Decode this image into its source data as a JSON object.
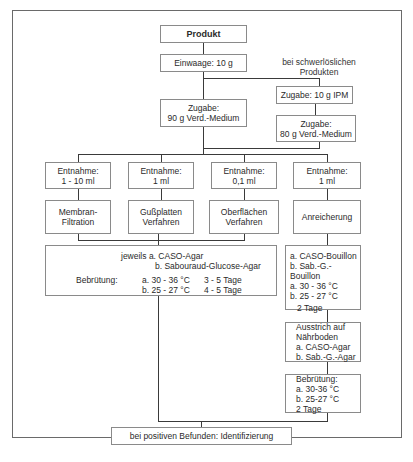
{
  "diagram": {
    "product": "Produkt",
    "weigh_in": "Einwaage: 10 g",
    "side_note": [
      "bei schwerlöslichen",
      "Produkten"
    ],
    "main_addition": [
      "Zugabe:",
      "90 g Verd.-Medium"
    ],
    "ipm_addition": "Zugabe: 10 g IPM",
    "alt_addition": [
      "Zugabe:",
      "80 g Verd.-Medium"
    ],
    "sampling": [
      {
        "line1": "Entnahme:",
        "line2": "1 - 10 ml"
      },
      {
        "line1": "Entnahme:",
        "line2": "1 ml"
      },
      {
        "line1": "Entnahme:",
        "line2": "0,1 ml"
      },
      {
        "line1": "Entnahme:",
        "line2": "1 ml"
      }
    ],
    "methods": [
      {
        "line1": "Membran-",
        "line2": "Filtration"
      },
      {
        "line1": "Gußplatten",
        "line2": "Verfahren"
      },
      {
        "line1": "Oberflächen",
        "line2": "Verfahren"
      },
      {
        "line1": "Anreicherung",
        "line2": ""
      }
    ],
    "media_box": {
      "prefix": "jeweils",
      "media_a": "a. CASO-Agar",
      "media_b": "b. Sabouraud-Glucose-Agar",
      "incubation_label": "Bebrütung:",
      "temp_a": "a. 30 - 36 °C",
      "days_a": "3 - 5 Tage",
      "temp_b": "b. 25 - 27 °C",
      "days_b": "4 - 5 Tage"
    },
    "broth_box": {
      "a": "a. CASO-Bouillon",
      "b": "b. Sab.-G.-Bouillon",
      "temp_a": "a. 30 - 36 °C",
      "temp_b": "b. 25 - 27 °C",
      "days": "2 Tage"
    },
    "streak_box": {
      "line1": "Ausstrich auf",
      "line2": "Nährboden",
      "a": "a. CASO-Agar",
      "b": "b. Sab.-G.-Agar"
    },
    "incubation_box": {
      "label": "Bebrütung:",
      "a": "a. 30-36 °C",
      "b": "b. 25-27 °C",
      "days": "2 Tage"
    },
    "final": "bei positiven Befunden: Identifizierung"
  }
}
